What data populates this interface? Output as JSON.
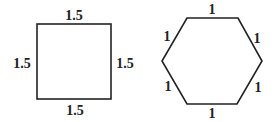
{
  "figures": {
    "square": {
      "shape": "square",
      "side_labels": {
        "top": "1.5",
        "left": "1.5",
        "right": "1.5",
        "bottom": "1.5"
      }
    },
    "hexagon": {
      "shape": "regular-hexagon",
      "side_labels": {
        "top": "1",
        "upper_left": "1",
        "upper_right": "1",
        "lower_left": "1",
        "lower_right": "1",
        "bottom": "1"
      }
    }
  },
  "colors": {
    "stroke": "#222222",
    "background": "#ffffff"
  }
}
